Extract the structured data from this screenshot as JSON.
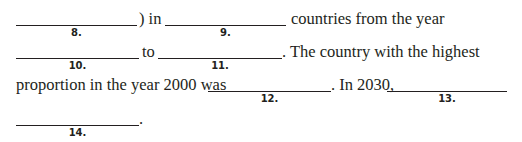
{
  "document": {
    "lines": [
      {
        "segments": [
          {
            "type": "blank",
            "label": "8."
          },
          {
            "type": "text",
            "value": ") in"
          },
          {
            "type": "blank",
            "label": "9."
          },
          {
            "type": "text",
            "value": "countries from the year"
          }
        ]
      },
      {
        "segments": [
          {
            "type": "blank",
            "label": "10."
          },
          {
            "type": "text",
            "value": "to"
          },
          {
            "type": "blank",
            "label": "11."
          },
          {
            "type": "text",
            "value": ". The country with the highest"
          }
        ]
      },
      {
        "segments": [
          {
            "type": "text",
            "value": "proportion in the year 2000 was"
          },
          {
            "type": "blank",
            "label": "12."
          },
          {
            "type": "text",
            "value": ". In 2030,"
          },
          {
            "type": "blank",
            "label": "13."
          }
        ]
      },
      {
        "segments": [
          {
            "type": "blank",
            "label": "14."
          },
          {
            "type": "text",
            "value": "."
          }
        ]
      }
    ]
  }
}
